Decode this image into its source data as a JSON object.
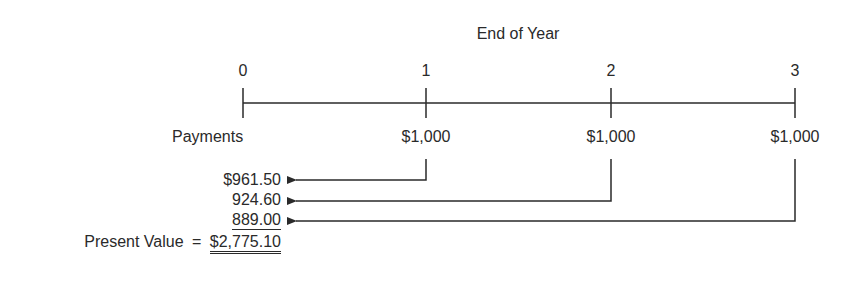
{
  "diagram": {
    "type": "timeline",
    "title": "End of Year",
    "periods": [
      {
        "label": "0",
        "x": 243
      },
      {
        "label": "1",
        "x": 426
      },
      {
        "label": "2",
        "x": 611
      },
      {
        "label": "3",
        "x": 795
      }
    ],
    "payments_label": "Payments",
    "payments": [
      {
        "period": "1",
        "amount": "$1,000"
      },
      {
        "period": "2",
        "amount": "$1,000"
      },
      {
        "period": "3",
        "amount": "$1,000"
      }
    ],
    "discounted_values": [
      {
        "from_period": "1",
        "value": "$961.50"
      },
      {
        "from_period": "2",
        "value": "924.60"
      },
      {
        "from_period": "3",
        "value": "889.00"
      }
    ],
    "present_value_label": "Present Value",
    "equals_sign": "=",
    "present_value_total": "$2,775.10"
  }
}
